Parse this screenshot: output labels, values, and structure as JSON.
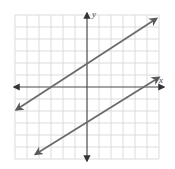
{
  "chart_data": {
    "type": "line",
    "title": "",
    "xlabel": "x",
    "ylabel": "y",
    "xlim": [
      -6,
      6
    ],
    "ylim": [
      -6,
      6
    ],
    "grid": true,
    "grid_step": 1,
    "tick_labels": false,
    "series": [
      {
        "name": "upper line",
        "equation": "y = (2/3)x + 2",
        "slope": 0.6667,
        "y_intercept": 2,
        "x_intercept": -3,
        "points": [
          [
            -6,
            -2
          ],
          [
            -3,
            0
          ],
          [
            0,
            2
          ],
          [
            3,
            4
          ],
          [
            6,
            6
          ]
        ],
        "arrows": "both",
        "color": "#6b6b6b"
      },
      {
        "name": "lower line",
        "equation": "y = (2/3)x - 3",
        "slope": 0.6667,
        "y_intercept": -3,
        "x_intercept": 4.5,
        "points": [
          [
            -4.5,
            -6
          ],
          [
            0,
            -3
          ],
          [
            4.5,
            0
          ],
          [
            6,
            1
          ]
        ],
        "arrows": "both",
        "color": "#6b6b6b"
      }
    ],
    "relationship": "parallel"
  },
  "axes": {
    "x_label": "x",
    "y_label": "y"
  },
  "colors": {
    "grid": "#dcdcdc",
    "axis": "#4a4a4a",
    "line": "#6b6b6b"
  }
}
